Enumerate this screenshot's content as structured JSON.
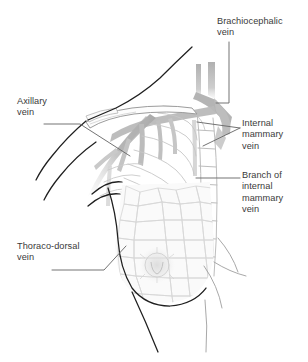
{
  "figure": {
    "kind": "anatomical-illustration",
    "background_color": "#ffffff",
    "ink_color": "#3a3a3a",
    "outline_color": "#1c1c1c",
    "vessel_color": "#b7b7b7",
    "faint_line_color": "#d9d9d9",
    "leader_color": "#6e6e6e"
  },
  "labels": [
    {
      "id": "brachiocephalic",
      "name": "brachiocephalic-vein-label",
      "text": "Brachiocephalic\nvein",
      "lines": [
        "Brachiocephalic",
        "vein"
      ]
    },
    {
      "id": "axillary",
      "name": "axillary-vein-label",
      "text": "Axillary\nvein",
      "lines": [
        "Axillary",
        "vein"
      ]
    },
    {
      "id": "internal-mammary",
      "name": "internal-mammary-vein-label",
      "text": "Internal\nmammary\nvein",
      "lines": [
        "Internal",
        "mammary",
        "vein"
      ]
    },
    {
      "id": "branch-internal-mammary",
      "name": "branch-of-internal-mammary-vein-label",
      "text": "Branch of\ninternal\nmammary\nvein",
      "lines": [
        "Branch of",
        "internal",
        "mammary",
        "vein"
      ]
    },
    {
      "id": "thoraco-dorsal",
      "name": "thoraco-dorsal-vein-label",
      "text": "Thoraco-dorsal\nvein",
      "lines": [
        "Thoraco-dorsal",
        "vein"
      ]
    }
  ],
  "structures": [
    {
      "name": "neck-and-shoulder-contour"
    },
    {
      "name": "clavicle"
    },
    {
      "name": "ribcage"
    },
    {
      "name": "sternum"
    },
    {
      "name": "breast"
    },
    {
      "name": "areola-and-nipple"
    },
    {
      "name": "brachiocephalic-vein"
    },
    {
      "name": "axillary-vein"
    },
    {
      "name": "internal-mammary-vein"
    },
    {
      "name": "branch-of-internal-mammary-vein"
    },
    {
      "name": "thoraco-dorsal-vein"
    },
    {
      "name": "torso-contour"
    }
  ]
}
